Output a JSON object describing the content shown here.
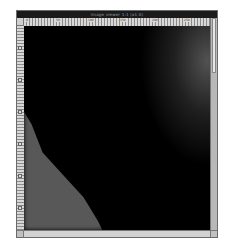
{
  "window": {
    "title": "image viewer 1:1 (x1.0)",
    "title_readable": false
  },
  "rulers": {
    "horizontal_labels": [
      "0",
      "50",
      "100",
      "150",
      "200",
      "250"
    ],
    "vertical_marks": 6
  },
  "scrollbar": {
    "vertical": {
      "thumb_position_pct": 0,
      "thumb_size_pct": 27
    },
    "horizontal": {
      "present": true
    }
  },
  "image": {
    "type": "grayscale",
    "description": "dark grayscale scan with lighter region at bottom-left and faint glow at top-right",
    "colors": {
      "background": "#000000",
      "light_region": "#585858",
      "glow": "#6e6e6e"
    }
  },
  "colors": {
    "titlebar": "#1a1a1a",
    "frame": "#c8c8c8",
    "ruler": "#d8d8d8"
  }
}
